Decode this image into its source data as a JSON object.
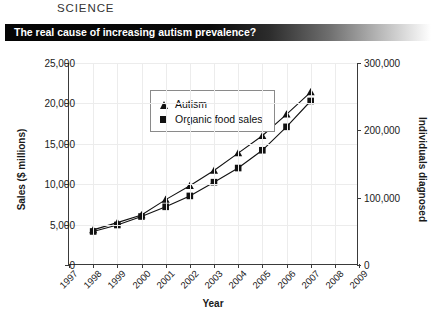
{
  "masthead": {
    "cropped_line": "",
    "word": "SCIENCE"
  },
  "banner": {
    "title": "The real cause of increasing autism prevalence?",
    "background_start": "#050505",
    "background_end": "#ffffff",
    "text_color": "#ffffff"
  },
  "chart_data": {
    "type": "line",
    "title": "The real cause of increasing autism prevalence?",
    "xlabel": "Year",
    "ylabel": "Sales ($ millions)",
    "y2label": "Individuals diagnosed",
    "x": [
      1998,
      1999,
      2000,
      2001,
      2002,
      2003,
      2004,
      2005,
      2006,
      2007
    ],
    "xlim": [
      1997,
      2009
    ],
    "xticks": [
      1997,
      1998,
      1999,
      2000,
      2001,
      2002,
      2003,
      2004,
      2005,
      2006,
      2007,
      2008,
      2009
    ],
    "xticklabels": [
      "1997",
      "1998",
      "1999",
      "2000",
      "2001",
      "2002",
      "2003",
      "2004",
      "2005",
      "2006",
      "2007",
      "2008",
      "2009"
    ],
    "ylim": [
      0,
      25000
    ],
    "yticks": [
      0,
      5000,
      10000,
      15000,
      20000,
      25000
    ],
    "yticklabels": [
      "0",
      "5,000",
      "10,000",
      "15,000",
      "20,000",
      "25,000"
    ],
    "y2lim": [
      0,
      300000
    ],
    "y2ticks": [
      0,
      100000,
      200000,
      300000
    ],
    "y2ticklabels": [
      "0",
      "100,000",
      "200,000",
      "300,000"
    ],
    "grid": true,
    "legend_position": "upper left",
    "series": [
      {
        "name": "Autism",
        "marker": "triangle",
        "color": "#111111",
        "axis": "right",
        "values": [
          52000,
          63000,
          74000,
          97000,
          117000,
          140000,
          166000,
          192000,
          224000,
          257000
        ],
        "plot_values": [
          4350,
          5250,
          6200,
          8100,
          9800,
          11700,
          13850,
          16000,
          18650,
          21400
        ]
      },
      {
        "name": "Organic food sales",
        "marker": "square",
        "color": "#111111",
        "axis": "left",
        "values": [
          4150,
          4950,
          6000,
          7200,
          8550,
          10250,
          12000,
          14200,
          17100,
          20300
        ],
        "plot_values": [
          4150,
          4950,
          6000,
          7200,
          8550,
          10250,
          12000,
          14200,
          17100,
          20300
        ]
      }
    ]
  },
  "legend": {
    "items": [
      {
        "label": "Autism",
        "marker": "triangle"
      },
      {
        "label": "Organic food sales",
        "marker": "square"
      }
    ]
  }
}
